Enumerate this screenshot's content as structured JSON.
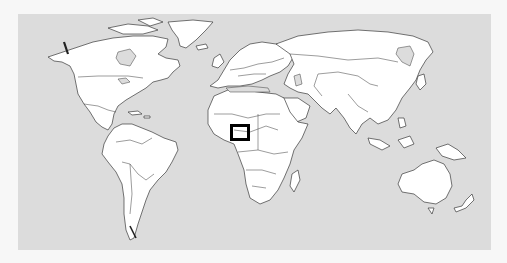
{
  "map": {
    "type": "world-locator-map",
    "projection": "equirectangular-like",
    "colors": {
      "ocean": "#dcdcdc",
      "land": "#ffffff",
      "borders": "#3a3a3a",
      "page_background": "#f7f7f7",
      "marker": "#000000"
    },
    "frame": {
      "x": 18,
      "y": 14,
      "width": 473,
      "height": 236
    },
    "marker": {
      "shape": "hollow-square",
      "region": "West/Central Africa (Nigeria–Cameroon area)",
      "x": 230,
      "y": 124,
      "width": 20,
      "height": 17,
      "stroke_width": 3
    },
    "labels": []
  }
}
